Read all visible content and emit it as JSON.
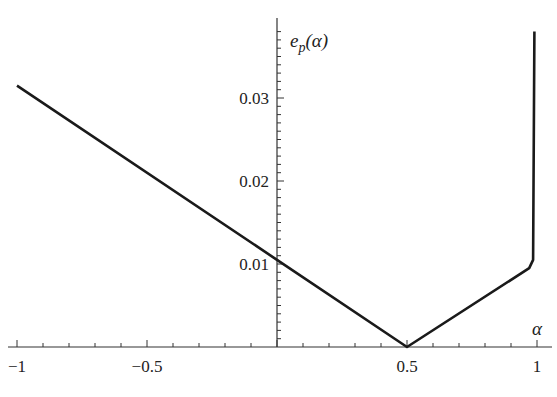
{
  "chart_data": {
    "type": "line",
    "title": "",
    "xlabel": "α",
    "ylabel": "e_p(α)",
    "ylabel_main": "e",
    "ylabel_sub": "p",
    "ylabel_arg": "(α)",
    "xlim": [
      -1,
      1
    ],
    "ylim": [
      0,
      0.038
    ],
    "grid": false,
    "legend": null,
    "x_ticks": [
      -1,
      -0.5,
      0.5,
      1
    ],
    "x_tick_labels": [
      "−1",
      "−0.5",
      "0.5",
      "1"
    ],
    "y_ticks": [
      0.01,
      0.02,
      0.03
    ],
    "y_tick_labels": [
      "0.01",
      "0.02",
      "0.03"
    ],
    "series": [
      {
        "name": "e_p(α)",
        "color": "#1a1a1a",
        "x": [
          -1,
          0,
          0.5,
          0.97,
          0.985,
          0.99
        ],
        "y": [
          0.0315,
          0.0105,
          0.0,
          0.0095,
          0.0105,
          0.038
        ]
      }
    ]
  }
}
